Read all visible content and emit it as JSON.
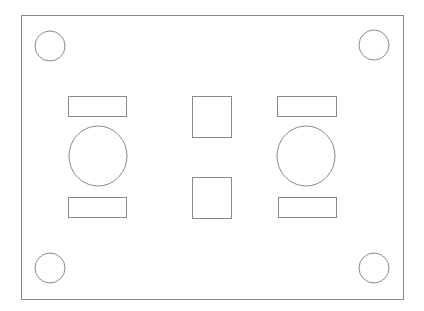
{
  "diagram": {
    "title": "",
    "stroke": "#8a8a8a",
    "fill": "#ffffff",
    "board": {
      "x": 21,
      "y": 15,
      "w": 382,
      "h": 284
    },
    "mounting_holes": [
      {
        "cx": 50,
        "cy": 46,
        "r": 15
      },
      {
        "cx": 374,
        "cy": 45,
        "r": 15
      },
      {
        "cx": 50,
        "cy": 268,
        "r": 15
      },
      {
        "cx": 374,
        "cy": 268,
        "r": 15
      }
    ],
    "rects": [
      {
        "name": "left-top-rect",
        "x": 68,
        "y": 96,
        "w": 58,
        "h": 20
      },
      {
        "name": "left-bottom-rect",
        "x": 68,
        "y": 197,
        "w": 58,
        "h": 20
      },
      {
        "name": "right-top-rect",
        "x": 277,
        "y": 96,
        "w": 59,
        "h": 20
      },
      {
        "name": "right-bottom-rect",
        "x": 278,
        "y": 197,
        "w": 58,
        "h": 20
      },
      {
        "name": "center-top-square",
        "x": 192,
        "y": 96,
        "w": 39,
        "h": 41
      },
      {
        "name": "center-bottom-square",
        "x": 192,
        "y": 177,
        "w": 39,
        "h": 41
      }
    ],
    "large_circles": [
      {
        "name": "left-large-circle",
        "cx": 98,
        "cy": 156,
        "rx": 29,
        "ry": 30
      },
      {
        "name": "right-large-circle",
        "cx": 306,
        "cy": 156,
        "rx": 29,
        "ry": 30
      }
    ]
  }
}
